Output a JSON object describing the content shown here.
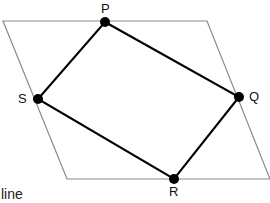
{
  "figure": {
    "type": "geometry-diagram",
    "canvas": {
      "width": 270,
      "height": 203,
      "background": "#ffffff"
    },
    "outer_shape": {
      "name": "parallelogram",
      "stroke_color": "#8a8a8a",
      "stroke_width": 1,
      "fill": "none",
      "points": [
        {
          "id": "A",
          "x": 3,
          "y": 21
        },
        {
          "id": "B",
          "x": 207,
          "y": 21
        },
        {
          "id": "C",
          "x": 270,
          "y": 179
        },
        {
          "id": "D",
          "x": 67,
          "y": 179
        }
      ]
    },
    "inner_shape": {
      "name": "quadrilateral-PQRS",
      "stroke_color": "#000000",
      "stroke_width": 2,
      "fill": "none",
      "points": [
        {
          "id": "P",
          "x": 105,
          "y": 22
        },
        {
          "id": "Q",
          "x": 239,
          "y": 97
        },
        {
          "id": "R",
          "x": 174,
          "y": 179
        },
        {
          "id": "S",
          "x": 38,
          "y": 99
        }
      ]
    },
    "vertex_markers": {
      "color": "#000000",
      "radius": 5,
      "points": [
        {
          "id": "P",
          "x": 105,
          "y": 22
        },
        {
          "id": "Q",
          "x": 239,
          "y": 97
        },
        {
          "id": "R",
          "x": 174,
          "y": 179
        },
        {
          "id": "S",
          "x": 38,
          "y": 99
        }
      ]
    },
    "labels": {
      "P": "P",
      "Q": "Q",
      "R": "R",
      "S": "S"
    },
    "caption_fragment": "line"
  }
}
